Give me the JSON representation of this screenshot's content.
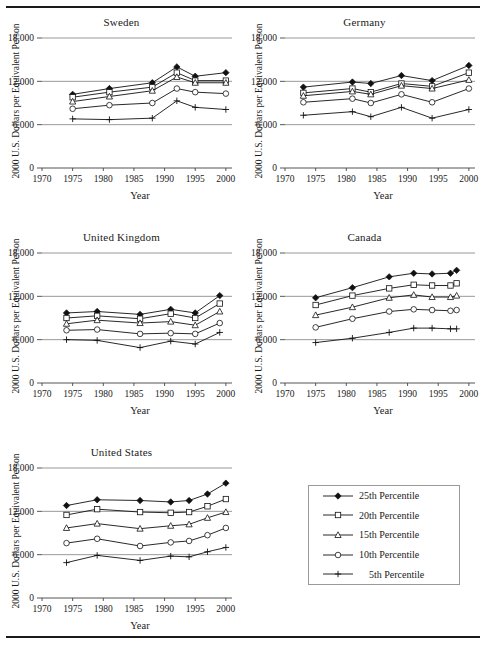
{
  "figure": {
    "y_axis_label": "2000 U.S. Dollars per Equivalent Person",
    "x_axis_label": "Year"
  },
  "legend": {
    "title": "",
    "items": [
      {
        "label": "25th Percentile",
        "marker": "filled-diamond-marker"
      },
      {
        "label": "20th Percentile",
        "marker": "open-square-marker"
      },
      {
        "label": "15th Percentile",
        "marker": "open-triangle-marker"
      },
      {
        "label": "10th Percentile",
        "marker": "open-circle-marker"
      },
      {
        "label": "5th Percentile",
        "marker": "plus-marker"
      }
    ]
  },
  "panel_titles": {
    "sweden": "Sweden",
    "germany": "Germany",
    "united_kingdom": "United Kingdom",
    "canada": "Canada",
    "united_states": "United States"
  },
  "axis": {
    "y_ticks": [
      "0",
      "6,000",
      "12,000",
      "18,000"
    ],
    "x_ticks": [
      "1970",
      "1975",
      "1980",
      "1985",
      "1990",
      "1995",
      "2000"
    ]
  },
  "chart_data": [
    {
      "type": "line",
      "title": "Sweden",
      "xlabel": "Year",
      "ylabel": "2000 U.S. Dollars per Equivalent Person",
      "xlim": [
        1970,
        2001
      ],
      "ylim": [
        0,
        18000
      ],
      "yticks": [
        0,
        6000,
        12000,
        18000
      ],
      "xticks": [
        1970,
        1975,
        1980,
        1985,
        1990,
        1995,
        2000
      ],
      "grid": true,
      "legend_position": "external",
      "x": [
        1975,
        1981,
        1988,
        1992,
        1995,
        2000
      ],
      "series": [
        {
          "name": "25th Percentile",
          "marker": "filled-diamond",
          "values": [
            10200,
            11000,
            11800,
            14000,
            12700,
            13200
          ]
        },
        {
          "name": "20th Percentile",
          "marker": "open-square",
          "values": [
            9800,
            10500,
            11200,
            13200,
            12100,
            12100
          ]
        },
        {
          "name": "15th Percentile",
          "marker": "open-triangle",
          "values": [
            9200,
            9900,
            10700,
            12600,
            11800,
            11800
          ]
        },
        {
          "name": "10th Percentile",
          "marker": "open-circle",
          "values": [
            8200,
            8700,
            9000,
            11000,
            10500,
            10300
          ]
        },
        {
          "name": "5th Percentile",
          "marker": "plus",
          "values": [
            6800,
            6700,
            6900,
            9300,
            8400,
            8100
          ]
        }
      ]
    },
    {
      "type": "line",
      "title": "Germany",
      "xlabel": "Year",
      "ylabel": "2000 U.S. Dollars per Equivalent Person",
      "xlim": [
        1970,
        2001
      ],
      "ylim": [
        0,
        18000
      ],
      "yticks": [
        0,
        6000,
        12000,
        18000
      ],
      "xticks": [
        1970,
        1975,
        1980,
        1985,
        1990,
        1995,
        2000
      ],
      "grid": true,
      "legend_position": "external",
      "x": [
        1973,
        1981,
        1984,
        1989,
        1994,
        2000
      ],
      "series": [
        {
          "name": "25th Percentile",
          "marker": "filled-diamond",
          "values": [
            11200,
            11900,
            11700,
            12800,
            12100,
            14200
          ]
        },
        {
          "name": "20th Percentile",
          "marker": "open-square",
          "values": [
            10400,
            11000,
            10500,
            11700,
            11300,
            13200
          ]
        },
        {
          "name": "15th Percentile",
          "marker": "open-triangle",
          "values": [
            10000,
            10600,
            10200,
            11400,
            11000,
            12200
          ]
        },
        {
          "name": "10th Percentile",
          "marker": "open-circle",
          "values": [
            9100,
            9600,
            9000,
            10200,
            9100,
            11000
          ]
        },
        {
          "name": "5th Percentile",
          "marker": "plus",
          "values": [
            7300,
            7800,
            7100,
            8400,
            6900,
            8100
          ]
        }
      ]
    },
    {
      "type": "line",
      "title": "United Kingdom",
      "xlabel": "Year",
      "ylabel": "2000 U.S. Dollars per Equivalent Person",
      "xlim": [
        1970,
        2001
      ],
      "ylim": [
        0,
        18000
      ],
      "yticks": [
        0,
        6000,
        12000,
        18000
      ],
      "xticks": [
        1970,
        1975,
        1980,
        1985,
        1990,
        1995,
        2000
      ],
      "grid": true,
      "legend_position": "external",
      "x": [
        1974,
        1979,
        1986,
        1991,
        1995,
        1999
      ],
      "series": [
        {
          "name": "25th Percentile",
          "marker": "filled-diamond",
          "values": [
            9700,
            9900,
            9500,
            10200,
            9700,
            12100
          ]
        },
        {
          "name": "20th Percentile",
          "marker": "open-square",
          "values": [
            9000,
            9300,
            8900,
            9600,
            9000,
            11000
          ]
        },
        {
          "name": "15th Percentile",
          "marker": "open-triangle",
          "values": [
            8200,
            8700,
            8300,
            8500,
            8000,
            9900
          ]
        },
        {
          "name": "10th Percentile",
          "marker": "open-circle",
          "values": [
            7300,
            7400,
            6800,
            6900,
            6800,
            8300
          ]
        },
        {
          "name": "5th Percentile",
          "marker": "plus",
          "values": [
            6000,
            5900,
            4900,
            5800,
            5400,
            7000
          ]
        }
      ]
    },
    {
      "type": "line",
      "title": "Canada",
      "xlabel": "Year",
      "ylabel": "2000 U.S. Dollars per Equivalent Person",
      "xlim": [
        1970,
        2001
      ],
      "ylim": [
        0,
        18000
      ],
      "yticks": [
        0,
        6000,
        12000,
        18000
      ],
      "xticks": [
        1970,
        1975,
        1980,
        1985,
        1990,
        1995,
        2000
      ],
      "grid": true,
      "legend_position": "external",
      "x": [
        1975,
        1981,
        1987,
        1991,
        1994,
        1997,
        1998
      ],
      "series": [
        {
          "name": "25th Percentile",
          "marker": "filled-diamond",
          "values": [
            11800,
            13200,
            14700,
            15200,
            15100,
            15200,
            15600
          ]
        },
        {
          "name": "20th Percentile",
          "marker": "open-square",
          "values": [
            10800,
            12100,
            13100,
            13600,
            13500,
            13500,
            13800
          ]
        },
        {
          "name": "15th Percentile",
          "marker": "open-triangle",
          "values": [
            9400,
            10500,
            11800,
            12200,
            11900,
            11900,
            12100
          ]
        },
        {
          "name": "10th Percentile",
          "marker": "open-circle",
          "values": [
            7700,
            8900,
            9900,
            10200,
            10100,
            10000,
            10100
          ]
        },
        {
          "name": "5th Percentile",
          "marker": "plus",
          "values": [
            5600,
            6200,
            7000,
            7600,
            7600,
            7500,
            7500
          ]
        }
      ]
    },
    {
      "type": "line",
      "title": "United States",
      "xlabel": "Year",
      "ylabel": "2000 U.S. Dollars per Equivalent Person",
      "xlim": [
        1970,
        2001
      ],
      "ylim": [
        0,
        18000
      ],
      "yticks": [
        0,
        6000,
        12000,
        18000
      ],
      "xticks": [
        1970,
        1975,
        1980,
        1985,
        1990,
        1995,
        2000
      ],
      "grid": true,
      "legend_position": "external",
      "x": [
        1974,
        1979,
        1986,
        1991,
        1994,
        1997,
        2000
      ],
      "series": [
        {
          "name": "25th Percentile",
          "marker": "filled-diamond",
          "values": [
            12800,
            13600,
            13500,
            13300,
            13500,
            14400,
            15900
          ]
        },
        {
          "name": "20th Percentile",
          "marker": "open-square",
          "values": [
            11500,
            12300,
            11900,
            11800,
            11900,
            12700,
            13700
          ]
        },
        {
          "name": "15th Percentile",
          "marker": "open-triangle",
          "values": [
            9700,
            10300,
            9600,
            10000,
            10200,
            11100,
            11900
          ]
        },
        {
          "name": "10th Percentile",
          "marker": "open-circle",
          "values": [
            7600,
            8200,
            7200,
            7700,
            7900,
            8700,
            9700
          ]
        },
        {
          "name": "5th Percentile",
          "marker": "plus",
          "values": [
            4900,
            5900,
            5200,
            5800,
            5700,
            6400,
            7000
          ]
        }
      ]
    }
  ]
}
